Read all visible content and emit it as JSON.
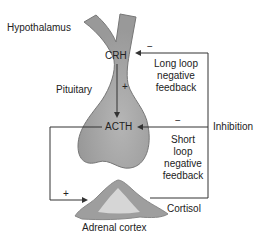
{
  "diagram": {
    "labels": {
      "hypothalamus": "Hypothalamus",
      "pituitary": "Pituitary",
      "crh": "CRH",
      "acth": "ACTH",
      "plus_crh_acth": "+",
      "plus_acth_adrenal": "+",
      "minus_long": "−",
      "minus_short": "−",
      "long_loop": [
        "Long loop",
        "negative",
        "feedback"
      ],
      "short_loop": [
        "Short",
        "loop",
        "negative",
        "feedback"
      ],
      "inhibition": "Inhibition",
      "cortisol": "Cortisol",
      "adrenal_cortex": "Adrenal cortex"
    },
    "colors": {
      "gland_fill": "#a8a8a8",
      "gland_stroke": "#777777",
      "adrenal_outer": "#9e9e9e",
      "adrenal_inner": "#d6d6d6",
      "line": "#333333"
    }
  }
}
